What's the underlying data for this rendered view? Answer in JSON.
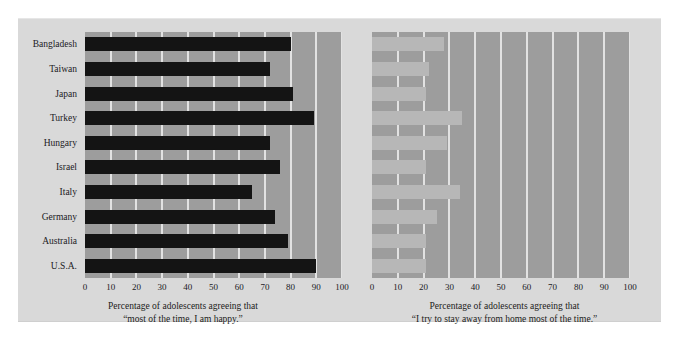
{
  "figure": {
    "background_color": "#ffffff",
    "panel_color": "#d9d9d9",
    "plot_color": "#9d9d9d",
    "gridline_color": "#e2e2e2",
    "bar_color_left": "#141414",
    "bar_color_right": "#b7b7b7",
    "text_color": "#20201e"
  },
  "chart_data": [
    {
      "type": "bar",
      "orientation": "horizontal",
      "id": "happy",
      "title": "",
      "categories": [
        "Bangladesh",
        "Taiwan",
        "Japan",
        "Turkey",
        "Hungary",
        "Israel",
        "Italy",
        "Germany",
        "Australia",
        "U.S.A."
      ],
      "values": [
        80,
        72,
        81,
        89,
        72,
        76,
        65,
        74,
        79,
        90
      ],
      "xlabel": "Percentage of adolescents agreeing that “most of the time, I am happy.”",
      "caption_line1": "Percentage of adolescents agreeing that",
      "caption_line2": "“most of the time, I am happy.”",
      "ylabel": "",
      "xlim": [
        0,
        100
      ],
      "xticks": [
        0,
        10,
        20,
        30,
        40,
        50,
        60,
        70,
        80,
        90,
        100
      ],
      "grid": true,
      "grid_axis": "x",
      "legend": false,
      "bar_color": "#141414"
    },
    {
      "type": "bar",
      "orientation": "horizontal",
      "id": "stay-away",
      "title": "",
      "categories": [
        "Bangladesh",
        "Taiwan",
        "Japan",
        "Turkey",
        "Hungary",
        "Israel",
        "Italy",
        "Germany",
        "Australia",
        "U.S.A."
      ],
      "values": [
        28,
        22,
        21,
        35,
        29,
        21,
        34,
        25,
        21,
        21
      ],
      "xlabel": "Percentage of adolescents agreeing that “I try to stay away from home most of the time.”",
      "caption_line1": "Percentage of adolescents agreeing that",
      "caption_line2": "“I try to stay away from home most of the time.”",
      "ylabel": "",
      "xlim": [
        0,
        100
      ],
      "xticks": [
        0,
        10,
        20,
        30,
        40,
        50,
        60,
        70,
        80,
        90,
        100
      ],
      "grid": true,
      "grid_axis": "x",
      "legend": false,
      "bar_color": "#b7b7b7"
    }
  ]
}
